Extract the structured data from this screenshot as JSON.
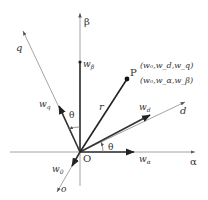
{
  "diagram": {
    "title": "",
    "colors": {
      "axis": "#9a9a9a",
      "vector": "#333333",
      "text": "#333333"
    },
    "origin": {
      "label": "O",
      "x": 80,
      "y": 152
    },
    "axes": [
      {
        "id": "alpha",
        "label": "α",
        "from": [
          10,
          152
        ],
        "to": [
          196,
          152
        ]
      },
      {
        "id": "beta",
        "label": "β",
        "from": [
          80,
          186
        ],
        "to": [
          80,
          12
        ]
      },
      {
        "id": "d",
        "label": "d",
        "from": [
          80,
          152
        ],
        "to": [
          186,
          101
        ]
      },
      {
        "id": "q",
        "label": "q",
        "from": [
          80,
          152
        ],
        "to": [
          23,
          30
        ]
      },
      {
        "id": "o",
        "label": "o",
        "from": [
          80,
          152
        ],
        "to": [
          57,
          193
        ]
      }
    ],
    "vectors": [
      {
        "id": "r",
        "label": "r",
        "to": [
          127,
          79
        ]
      },
      {
        "id": "w_beta",
        "label": "w",
        "sub": "β",
        "to": [
          80,
          62
        ]
      },
      {
        "id": "w_q",
        "label": "w",
        "sub": "q",
        "to": [
          58,
          105
        ]
      },
      {
        "id": "w_d",
        "label": "w",
        "sub": "d",
        "to": [
          151,
          115
        ]
      },
      {
        "id": "w_alpha",
        "label": "w",
        "sub": "α",
        "to": [
          135,
          152
        ]
      },
      {
        "id": "w_0",
        "label": "w",
        "sub": "0",
        "to": [
          72,
          166
        ]
      }
    ],
    "point": {
      "label": "P",
      "coords_dq": "(w₀,w_d,w_q)",
      "coords_ab": "(w₀,w_α,w_β)"
    },
    "angles": [
      {
        "label": "θ",
        "between": "alpha-d"
      },
      {
        "label": "θ",
        "between": "beta-q"
      }
    ]
  }
}
